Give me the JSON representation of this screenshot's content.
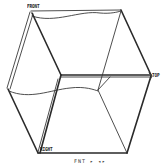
{
  "diagram": {
    "type": "view-cube",
    "labels": {
      "front": "FRONT",
      "top": "TOP",
      "right": "RIGHT"
    },
    "caption": "FNT ▸ ◂▸",
    "colors": {
      "background": "#ffffff",
      "edge": "#2a2a2a",
      "text": "#1e1e1e"
    }
  }
}
